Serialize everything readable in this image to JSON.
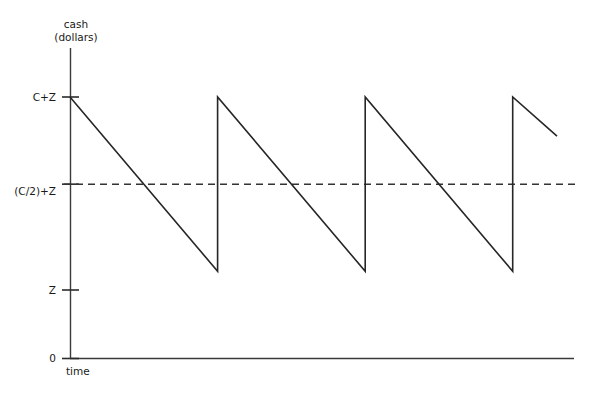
{
  "chart_data": {
    "type": "line",
    "title": "",
    "subtitle": "",
    "xlabel": "time",
    "ylabel": "cash\n(dollars)",
    "ylabel_line1": "cash",
    "ylabel_line2": "(dollars)",
    "grid": false,
    "legend": null,
    "axis_style": "open-axes-with-arrowless-spines",
    "y_tick_labels": [
      "C+Z",
      "(C/2)+Z",
      "Z",
      "0"
    ],
    "y_tick_values": [
      3,
      2,
      1,
      0
    ],
    "x_tick_labels": [],
    "xlim": [
      0,
      3.55
    ],
    "ylim": [
      0,
      3.4
    ],
    "series": [
      {
        "name": "cash balance",
        "shape": "sawtooth",
        "description": "Cash declines linearly from C+Z down to Z, then jumps instantly back up to C+Z, repeating.",
        "points": [
          {
            "x": 0.0,
            "y": 3
          },
          {
            "x": 1.0,
            "y": 1
          },
          {
            "x": 1.0,
            "y": 3
          },
          {
            "x": 2.0,
            "y": 1
          },
          {
            "x": 2.0,
            "y": 3
          },
          {
            "x": 3.0,
            "y": 1
          },
          {
            "x": 3.0,
            "y": 3
          },
          {
            "x": 3.3,
            "y": 2.55
          }
        ]
      }
    ],
    "reference_lines": [
      {
        "name": "average-cash-line",
        "orientation": "horizontal",
        "y": 2,
        "label": "(C/2)+Z",
        "style": "dashed"
      }
    ],
    "colors": {
      "line": "#262626",
      "axis": "#333333",
      "text": "#1a1a1a",
      "background": "#ffffff",
      "dashed": "#333333"
    }
  },
  "labels": {
    "y_axis_title_line1": "cash",
    "y_axis_title_line2": "(dollars)",
    "x_axis_title": "time",
    "tick_c_plus_z": "C+Z",
    "tick_half_c_plus_z": "(C/2)+Z",
    "tick_z": "Z",
    "tick_zero": "0"
  }
}
